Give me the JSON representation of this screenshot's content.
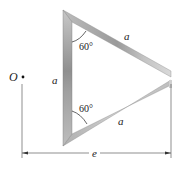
{
  "diagram": {
    "type": "mechanics-figure",
    "labels": {
      "point_O": "O",
      "side_left": "a",
      "side_top": "a",
      "side_bottom": "a",
      "angle_top": "60°",
      "angle_bottom": "60°",
      "dimension": "e"
    },
    "colors": {
      "bar_light": "#d8d8d8",
      "bar_mid": "#a9a9a9",
      "bar_dark": "#8c8c8c",
      "line": "#333333",
      "background": "#ffffff"
    }
  }
}
